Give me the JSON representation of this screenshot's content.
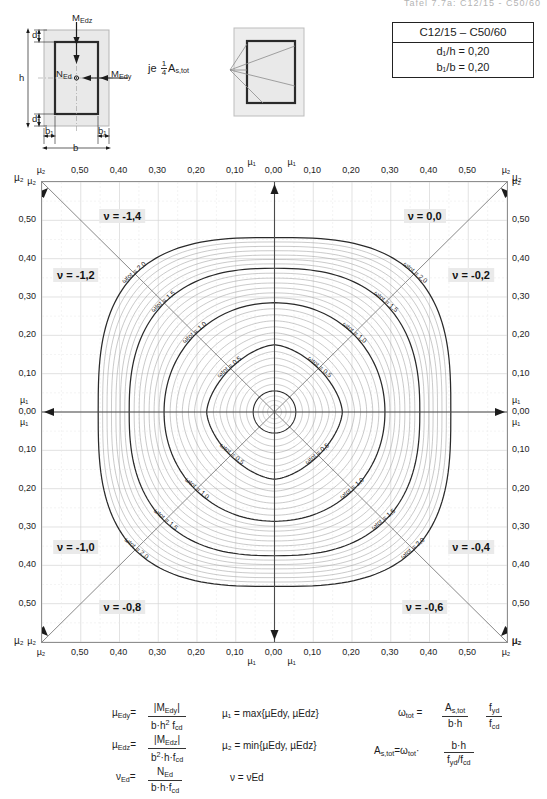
{
  "header": {
    "cut_title": "Tafel 7.7a: C12/15 - C50/60"
  },
  "prop_table": {
    "concrete_class": "C12/15 – C50/60",
    "rows": [
      {
        "label": "d₁/h",
        "eq": "=",
        "value": "0,20"
      },
      {
        "label": "b₁/b",
        "eq": "=",
        "value": "0,20"
      }
    ]
  },
  "cross_section": {
    "labels": {
      "m_edz": "M",
      "m_edz_sub": "Edz",
      "m_edy": "M",
      "m_edy_sub": "Edy",
      "n_ed": "N",
      "n_ed_sub": "Ed",
      "h": "h",
      "b": "b",
      "d1": "d₁",
      "b1": "b₁"
    }
  },
  "rebar_figure": {
    "caption_prefix": "je",
    "caption_fraction_num": "1",
    "caption_fraction_den": "4",
    "caption_symbol": "A",
    "caption_symbol_sub": "s,tot"
  },
  "chart_data": {
    "type": "line",
    "xlabel": "µ₁ / µ₂",
    "ylabel": "µ₁ / µ₂",
    "grid": true,
    "axis_max": 0.6,
    "x_ticks_left": [
      "µ₂",
      "0,50",
      "0,40",
      "0,30",
      "0,20",
      "0,10"
    ],
    "x_ticks_right": [
      "0,10",
      "0,20",
      "0,30",
      "0,40",
      "0,50",
      "µ₂"
    ],
    "x_center_ticks": [
      "µ₁",
      "0,00",
      "µ₁"
    ],
    "y_ticks_upper": [
      "µ₂",
      "0,50",
      "0,40",
      "0,30",
      "0,20",
      "0,10"
    ],
    "y_ticks_lower": [
      "0,10",
      "0,20",
      "0,30",
      "0,40",
      "0,50",
      "µ₂"
    ],
    "y_center_ticks": [
      "µ₁",
      "0,00",
      "µ₁"
    ],
    "tick_values": [
      0.6,
      0.5,
      0.4,
      0.3,
      0.2,
      0.1,
      0.0
    ],
    "axis_end_label": "µ₂",
    "nu_labels": [
      {
        "text": "ν = -1,4",
        "x": 0.175,
        "y": 0.075,
        "quadrant": "upper-left"
      },
      {
        "text": "ν = -1,2",
        "x": 0.075,
        "y": 0.205,
        "quadrant": "upper-left"
      },
      {
        "text": "ν = 0,0",
        "x": 0.825,
        "y": 0.075,
        "quadrant": "upper-right"
      },
      {
        "text": "ν = -0,2",
        "x": 0.925,
        "y": 0.205,
        "quadrant": "upper-right"
      },
      {
        "text": "ν = -1,0",
        "x": 0.075,
        "y": 0.795,
        "quadrant": "lower-left"
      },
      {
        "text": "ν = -0,8",
        "x": 0.175,
        "y": 0.925,
        "quadrant": "lower-left"
      },
      {
        "text": "ν = -0,4",
        "x": 0.925,
        "y": 0.795,
        "quadrant": "lower-right"
      },
      {
        "text": "ν = -0,6",
        "x": 0.825,
        "y": 0.925,
        "quadrant": "lower-right"
      }
    ],
    "omega_series": [
      {
        "label": "ωtot = 0,5",
        "omega": 0.5,
        "radius": 0.175
      },
      {
        "label": "ωtot = 1,0",
        "omega": 1.0,
        "radius": 0.285
      },
      {
        "label": "ωtot = 1,5",
        "omega": 1.5,
        "radius": 0.375
      },
      {
        "label": "ωtot = 2,0",
        "omega": 2.0,
        "radius": 0.455
      }
    ],
    "omega_intermediate_count": 6,
    "legend_position": "inline-on-curves"
  },
  "formulas": {
    "col1": [
      {
        "lhs": "µ",
        "lhs_sub": "Edy",
        "num": "|M",
        "num_sub": "Edy",
        "num_tail": "|",
        "den": "b·h",
        "den_sup": "2",
        "den_tail": " f",
        "den_sub2": "cd"
      },
      {
        "lhs": "µ",
        "lhs_sub": "Edz",
        "num": "|M",
        "num_sub": "Edz",
        "num_tail": "|",
        "den": "b",
        "den_sup": "2",
        "den_tail": "·h·f",
        "den_sub2": "cd"
      },
      {
        "lhs": "ν",
        "lhs_sub": "Ed",
        "num": "N",
        "num_sub": "Ed",
        "num_tail": "",
        "den": "b·h·f",
        "den_sup": "",
        "den_tail": "",
        "den_sub2": "cd"
      }
    ],
    "col2": [
      "µ₁  =  max{µEdy, µEdz}",
      "µ₂  =  min{µEdy, µEdz}",
      "ν  =  νEd"
    ],
    "col3_omega": {
      "lhs": "ω",
      "lhs_sub": "tot",
      "eq": "=",
      "f1_num": "A",
      "f1_num_sub": "s,tot",
      "f1_den": "b·h",
      "f2_num": "f",
      "f2_num_sub": "yd",
      "f2_den": "f",
      "f2_den_sub": "cd"
    },
    "col3_as": {
      "lhs": "A",
      "lhs_sub": "s,tot",
      "eq": "=",
      "factor": "ω",
      "factor_sub": "tot",
      "dot": "·",
      "num": "b·h",
      "den": "f",
      "den_sub": "yd",
      "den_mid": "/f",
      "den_sub2": "cd"
    }
  }
}
